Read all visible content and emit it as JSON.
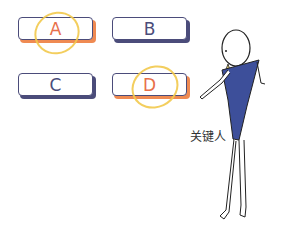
{
  "options": [
    {
      "label": "A",
      "highlighted": true
    },
    {
      "label": "B",
      "highlighted": false
    },
    {
      "label": "C",
      "highlighted": false
    },
    {
      "label": "D",
      "highlighted": true
    }
  ],
  "figure": {
    "caption": "关键人"
  },
  "colors": {
    "highlight_text": "#e8704a",
    "highlight_shadow": "#ef8a52",
    "normal_text": "#4b4c7a",
    "normal_shadow": "#4b4c7a",
    "ring": "#f2c94c",
    "body": "#3d4f9a"
  }
}
